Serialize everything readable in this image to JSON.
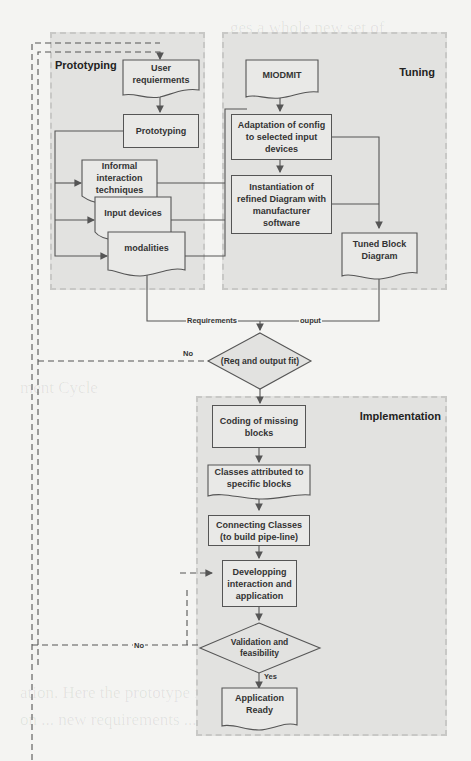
{
  "regions": {
    "prototyping": "Prototyping",
    "tuning": "Tuning",
    "implementation": "Implementation"
  },
  "nodes": {
    "user_requirements": "User requierments",
    "prototyping": "Prototyping",
    "informal_interaction": "Informal interaction techniques",
    "input_devices": "Input devices",
    "modalities": "modalities",
    "miodmit": "MIODMIT",
    "adaptation": "Adaptation of config to selected input devices",
    "instantiation": "Instantiation of refined Diagram with manufacturer software",
    "tuned_block": "Tuned Block Diagram",
    "decision_fit": "(Req and output fit)",
    "coding": "Coding of missing blocks",
    "classes": "Classes attributed to specific blocks",
    "connecting": "Connecting Classes (to build pipe-line)",
    "developing": "Developping interaction and application",
    "validation": "Validation and feasibility",
    "app_ready": "Application Ready"
  },
  "edge_labels": {
    "requirements": "Requirements",
    "output": "ouput",
    "no_fit": "No",
    "no_validation": "No",
    "yes": "Yes"
  },
  "colors": {
    "region_fill": "#e2e2e0",
    "node_fill": "#e9e9e7",
    "line": "#555555",
    "page": "#f4f4f2"
  }
}
